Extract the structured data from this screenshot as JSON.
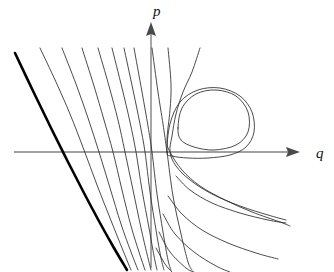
{
  "figure": {
    "title": "",
    "caption": "",
    "background_color": "#ffffff",
    "width": 334,
    "height": 272
  },
  "axes": {
    "horizontal": {
      "name": "q-axis",
      "label": "q",
      "label_position": {
        "x": 318,
        "y": 157
      },
      "color": "#808080",
      "start": {
        "x": 14,
        "y": 152
      },
      "end": {
        "x": 300,
        "y": 152
      },
      "arrow": "right"
    },
    "vertical": {
      "name": "p-axis",
      "label": "p",
      "label_position": {
        "x": 155,
        "y": 15
      },
      "color": "#808080",
      "start": {
        "x": 151,
        "y": 268
      },
      "end": {
        "x": 151,
        "y": 22
      },
      "arrow": "up"
    }
  },
  "chart_data": {
    "type": "line",
    "title": "",
    "subtitle": "",
    "xlabel": "q",
    "ylabel": "p",
    "grid": false,
    "legend": null,
    "features": [
      {
        "name": "saddle-point",
        "location": {
          "q_px": 167,
          "p_px": 152
        },
        "note": "homoclinic pinch point on the q-axis"
      },
      {
        "name": "center-fixed-point",
        "location": {
          "q_px": 213,
          "p_px": 118
        },
        "note": "interior of the closed periodic orbit"
      }
    ],
    "series": [
      {
        "name": "separatrix-bold",
        "style": "bold",
        "color": "#000000",
        "stroke_width": 2.6,
        "points": [
          [
            15,
            53
          ],
          [
            34,
            93
          ],
          [
            52,
            130
          ],
          [
            68,
            162
          ],
          [
            84,
            193
          ],
          [
            100,
            223
          ],
          [
            114,
            248
          ],
          [
            127,
            270
          ]
        ]
      },
      {
        "name": "left-orbit-1",
        "style": "thin",
        "points": [
          [
            40,
            48
          ],
          [
            56,
            82
          ],
          [
            70,
            114
          ],
          [
            84,
            150
          ],
          [
            97,
            185
          ],
          [
            110,
            218
          ],
          [
            122,
            248
          ],
          [
            131,
            270
          ]
        ]
      },
      {
        "name": "left-orbit-2",
        "style": "thin",
        "points": [
          [
            62,
            48
          ],
          [
            76,
            84
          ],
          [
            88,
            118
          ],
          [
            99,
            152
          ],
          [
            110,
            188
          ],
          [
            121,
            224
          ],
          [
            131,
            252
          ],
          [
            138,
            270
          ]
        ]
      },
      {
        "name": "left-orbit-3",
        "style": "thin",
        "points": [
          [
            82,
            48
          ],
          [
            94,
            86
          ],
          [
            104,
            120
          ],
          [
            113,
            152
          ],
          [
            122,
            190
          ],
          [
            131,
            226
          ],
          [
            139,
            252
          ],
          [
            145,
            270
          ]
        ]
      },
      {
        "name": "left-orbit-4",
        "style": "thin",
        "points": [
          [
            98,
            48
          ],
          [
            109,
            86
          ],
          [
            118,
            120
          ],
          [
            125,
            152
          ],
          [
            133,
            190
          ],
          [
            141,
            228
          ],
          [
            147,
            254
          ],
          [
            151,
            270
          ]
        ]
      },
      {
        "name": "left-orbit-5",
        "style": "thin",
        "points": [
          [
            112,
            48
          ],
          [
            122,
            88
          ],
          [
            130,
            122
          ],
          [
            136,
            152
          ],
          [
            142,
            190
          ],
          [
            149,
            228
          ],
          [
            154,
            256
          ],
          [
            157,
            270
          ]
        ]
      },
      {
        "name": "left-orbit-6",
        "style": "thin",
        "points": [
          [
            124,
            48
          ],
          [
            133,
            90
          ],
          [
            140,
            124
          ],
          [
            145,
            152
          ],
          [
            150,
            192
          ],
          [
            156,
            230
          ],
          [
            161,
            258
          ],
          [
            164,
            270
          ]
        ]
      },
      {
        "name": "left-orbit-7",
        "style": "thin",
        "points": [
          [
            134,
            48
          ],
          [
            142,
            92
          ],
          [
            148,
            126
          ],
          [
            152,
            152
          ],
          [
            157,
            194
          ],
          [
            163,
            232
          ],
          [
            168,
            260
          ],
          [
            171,
            270
          ]
        ]
      },
      {
        "name": "inner-separatrix-upper",
        "style": "thin",
        "points": [
          [
            152,
            48
          ],
          [
            158,
            92
          ],
          [
            163,
            124
          ],
          [
            167,
            152
          ],
          [
            173,
            196
          ],
          [
            181,
            234
          ],
          [
            188,
            262
          ],
          [
            192,
            270
          ]
        ]
      },
      {
        "name": "separatrix-loop-upper",
        "style": "thin",
        "points": [
          [
            168,
            48
          ],
          [
            171,
            84
          ],
          [
            170,
            110
          ],
          [
            167,
            140
          ],
          [
            170,
            152
          ],
          [
            182,
            170
          ],
          [
            200,
            186
          ],
          [
            225,
            200
          ],
          [
            252,
            212
          ],
          [
            280,
            222
          ],
          [
            290,
            226
          ]
        ]
      },
      {
        "name": "separatrix-loop-outer",
        "style": "thin",
        "points": [
          [
            200,
            48
          ],
          [
            192,
            72
          ],
          [
            183,
            92
          ],
          [
            176,
            114
          ],
          [
            172,
            136
          ],
          [
            170,
            152
          ],
          [
            176,
            166
          ],
          [
            190,
            180
          ],
          [
            212,
            194
          ],
          [
            240,
            206
          ],
          [
            268,
            215
          ],
          [
            286,
            220
          ]
        ]
      },
      {
        "name": "homoclinic-loop",
        "style": "thin",
        "points": [
          [
            167,
            152
          ],
          [
            170,
            124
          ],
          [
            180,
            102
          ],
          [
            198,
            90
          ],
          [
            220,
            88
          ],
          [
            240,
            96
          ],
          [
            252,
            112
          ],
          [
            254,
            132
          ],
          [
            246,
            147
          ],
          [
            230,
            155
          ],
          [
            208,
            158
          ],
          [
            188,
            158
          ],
          [
            172,
            156
          ],
          [
            167,
            152
          ]
        ],
        "closed": true
      },
      {
        "name": "closed-periodic-orbit",
        "style": "thin",
        "points": [
          [
            178,
            128
          ],
          [
            182,
            108
          ],
          [
            196,
            94
          ],
          [
            216,
            90
          ],
          [
            236,
            96
          ],
          [
            248,
            112
          ],
          [
            248,
            132
          ],
          [
            236,
            145
          ],
          [
            214,
            150
          ],
          [
            194,
            147
          ],
          [
            181,
            140
          ],
          [
            178,
            128
          ]
        ],
        "closed": true
      },
      {
        "name": "right-orbit-1",
        "style": "thin",
        "points": [
          [
            176,
            176
          ],
          [
            190,
            190
          ],
          [
            212,
            203
          ],
          [
            240,
            213
          ],
          [
            268,
            220
          ],
          [
            286,
            223
          ]
        ]
      },
      {
        "name": "right-orbit-2",
        "style": "thin",
        "points": [
          [
            168,
            196
          ],
          [
            182,
            214
          ],
          [
            202,
            230
          ],
          [
            228,
            243
          ],
          [
            256,
            253
          ],
          [
            278,
            259
          ]
        ]
      },
      {
        "name": "right-orbit-3",
        "style": "thin",
        "points": [
          [
            163,
            214
          ],
          [
            175,
            234
          ],
          [
            194,
            252
          ],
          [
            216,
            266
          ],
          [
            230,
            272
          ]
        ]
      },
      {
        "name": "right-orbit-4",
        "style": "thin",
        "points": [
          [
            159,
            232
          ],
          [
            170,
            252
          ],
          [
            186,
            268
          ],
          [
            194,
            272
          ]
        ]
      },
      {
        "name": "right-orbit-5",
        "style": "thin",
        "points": [
          [
            156,
            248
          ],
          [
            165,
            264
          ],
          [
            172,
            272
          ]
        ]
      }
    ],
    "xlim": [
      null,
      null
    ],
    "ylim": [
      null,
      null
    ]
  }
}
